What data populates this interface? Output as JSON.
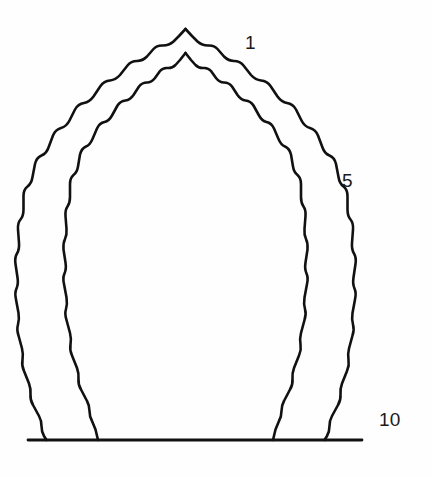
{
  "figure": {
    "background_color": "#fefefe",
    "line_color": "#111111"
  },
  "annotations": {
    "labels": [
      {
        "id": "1",
        "text": "1",
        "meaning": "first cusp, counted from the apex"
      },
      {
        "id": "5",
        "text": "5",
        "meaning": "fifth cusp, counted from the apex"
      },
      {
        "id": "10",
        "text": "10",
        "meaning": "tenth cusp, at the springing / base line"
      }
    ]
  },
  "geometry": {
    "cusp_count_per_side": 10,
    "apex_x": 185,
    "apex_y_outer": 28,
    "apex_y_inner": 52,
    "baseline_y": 440,
    "baseline_x_start": 28,
    "baseline_x_end": 362,
    "contour_offset_px": 8,
    "outer_outline_path": "M 185.5 29 L 179 36 L 173.5 41.5 Q 169 45.5 163 45.5 Q 157 45 153.5 49 L 147 56.5 Q 142.5 61 137 61 Q 131 61 127.5 65.5 L 120 75 Q 115.5 80 110 80.5 Q 104 81 100.5 86 L 93.5 96.5 Q 89.5 102 84 103 Q 78 104 75 109.5 L 69.5 120.5 Q 66.5 126.5 61 128 Q 55.5 129.5 53 135.5 L 48.5 147.5 Q 46.5 153.5 41.5 155.5 Q 36.5 157.5 35 164 L 32.5 177 Q 31.5 183.5 27.5 186.5 Q 23.5 189.5 23.5 196 L 23.5 209.5 Q 23.5 216 20.5 219.5 Q 17.5 223 18 229.5 L 19 243 Q 19.5 249.5 17 253.5 Q 14.5 257.5 15.5 264 L 17.5 277.5 Q 18.5 284 16.5 288.5 Q 14.5 293 16 299.5 L 18.5 313 Q 19.5 319.5 18 324.5 Q 16.5 329.5 18.5 335.5 L 22 348.5 Q 23.5 354.5 22.5 360 Q 21.5 365.5 24 371 L 29 383.5 Q 31 389 30.5 394.5 Q 30 400 33 405 L 39 416 Q 41.5 420.5 41.5 426 Q 41.5 431.5 44 436 L 46.5 440",
    "inner_outline_path": "M 185.5 53 L 180 60 L 175.5 65 Q 172 68.5 167.5 68 Q 163 67.5 160 71 L 155 78 Q 151.5 82.5 147 82.5 Q 142 82.5 139 86.5 L 133.5 95 Q 130 100 125.5 100.5 Q 120.5 101 117.5 105.5 L 112 115.5 Q 109 121 104.5 122 Q 99.5 123 97 128.5 L 92.5 139 Q 90 145 86 146.5 Q 81.5 148.5 80 154.5 L 78 166.5 Q 77 172.5 73.5 175 Q 70 178 70 184 L 70 197 Q 70 203 67.5 206.5 Q 65 210 65.5 216 L 66.5 229 Q 67 235 65 239 Q 63 243 63.5 249.5 L 65.5 262.5 Q 66.5 269 64.5 273.5 Q 62.5 278 64 284 L 66.5 297.5 Q 67.5 304 66 309 Q 64.5 314 66.5 320 L 70 333 Q 71.5 339 70.5 344.5 Q 69.5 350 72 355.5 L 77 368 Q 79 373.5 78.5 379 Q 78 384.5 81 389.5 L 87 401 Q 89.5 405.5 89.5 411 Q 89.5 416.5 92 421 L 95.5 429.5 L 98 440",
    "outer_outline_path_right": "M 185.5 29 L 192 36 L 197.5 41.5 Q 202 45.5 208 45.5 Q 214 45 217.5 49 L 224 56.5 Q 228.5 61 234 61 Q 240 61 243.5 65.5 L 251 75 Q 255.5 80 261 80.5 Q 267 81 270.5 86 L 277.5 96.5 Q 281.5 102 287 103 Q 293 104 296 109.5 L 301.5 120.5 Q 304.5 126.5 310 128 Q 315.5 129.5 318 135.5 L 322.5 147.5 Q 324.5 153.5 329.5 155.5 Q 334.5 157.5 336 164 L 338.5 177 Q 339.5 183.5 343.5 186.5 Q 347.5 189.5 347.5 196 L 347.5 209.5 Q 347.5 216 350.5 219.5 Q 353.5 223 353 229.5 L 352 243 Q 351.5 249.5 354 253.5 Q 356.5 257.5 355.5 264 L 353.5 277.5 Q 352.5 284 354.5 288.5 Q 356.5 293 355 299.5 L 352.5 313 Q 351.5 319.5 353 324.5 Q 354.5 329.5 352.5 335.5 L 349 348.5 Q 347.5 354.5 348.5 360 Q 349.5 365.5 347 371 L 342 383.5 Q 340 389 340.5 394.5 Q 341 400 338 405 L 332 416 Q 329.5 420.5 329.5 426 Q 329.5 431.5 327 436 L 324.5 440",
    "inner_outline_path_right": "M 185.5 53 L 191 60 L 195.5 65 Q 199 68.5 203.5 68 Q 208 67.5 211 71 L 216 78 Q 219.5 82.5 224 82.5 Q 229 82.5 232 86.5 L 237.5 95 Q 241 100 245.5 100.5 Q 250.5 101 253.5 105.5 L 259 115.5 Q 262 121 266.5 122 Q 271.5 123 274 128.5 L 278.5 139 Q 281 145 285 146.5 Q 289.5 148.5 291 154.5 L 293 166.5 Q 294 172.5 297.5 175 Q 301 178 301 184 L 301 197 Q 301 203 303.5 206.5 Q 306 210 305.5 216 L 304.5 229 Q 304 235 306 239 Q 308 243 307.5 249.5 L 305.5 262.5 Q 304.5 269 306.5 273.5 Q 308.5 278 307 284 L 304.5 297.5 Q 303.5 304 305 309 Q 306.5 314 304.5 320 L 301 333 Q 299.5 339 300.5 344.5 Q 301.5 350 299 355.5 L 294 368 Q 292 373.5 292.5 379 Q 293 384.5 290 389.5 L 284 401 Q 281.5 405.5 281.5 411 Q 281.5 416.5 279 421 L 275.5 429.5 L 273 440"
  }
}
